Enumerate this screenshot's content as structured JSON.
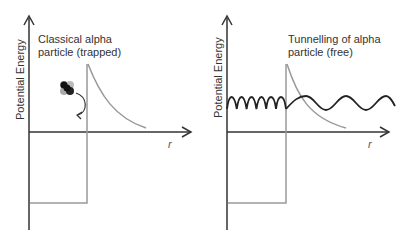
{
  "diagrams": [
    {
      "id": "left",
      "ylabel": "Potential Energy",
      "xlabel": "r",
      "caption_line1": "Classical alpha",
      "caption_line2": "particle (trapped)",
      "elements": [
        "potential well",
        "coulomb barrier",
        "alpha particle icon",
        "curved arrow bouncing back"
      ]
    },
    {
      "id": "right",
      "ylabel": "Potential Energy",
      "xlabel": "r",
      "caption_line1": "Tunnelling of alpha",
      "caption_line2": "particle (free)",
      "elements": [
        "potential well",
        "coulomb barrier",
        "wavefunction inside (short wavelength)",
        "wavefunction outside (long wavelength)"
      ]
    }
  ],
  "colors": {
    "axis": "#333333",
    "barrier": "#999999",
    "wave": "#222222"
  }
}
